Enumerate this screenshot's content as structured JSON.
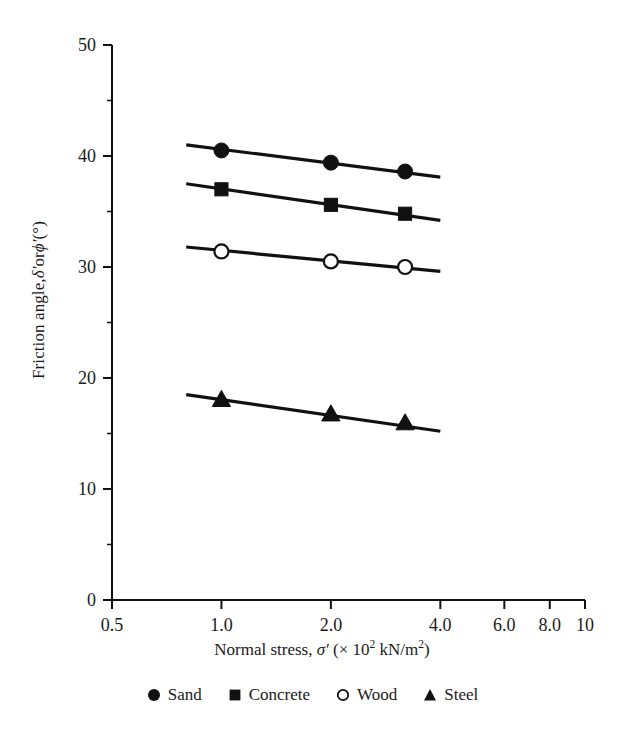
{
  "chart_data": {
    "type": "line",
    "title": "",
    "xlabel": "Normal stress, σ′ (× 10² kN/m²)",
    "ylabel": "Friction angle, δ′ or ϕ′ (°)",
    "xscale": "log",
    "xlim": [
      0.5,
      10
    ],
    "ylim": [
      0,
      50
    ],
    "xticks": [
      0.5,
      1.0,
      2.0,
      4.0,
      6.0,
      8.0,
      10
    ],
    "xtick_labels": [
      "0.5",
      "1.0",
      "2.0",
      "4.0",
      "6.0",
      "8.0",
      "10"
    ],
    "yticks": [
      0,
      10,
      20,
      30,
      40,
      50
    ],
    "ytick_labels": [
      "0",
      "10",
      "20",
      "30",
      "40",
      "50"
    ],
    "yminor_ticks": [
      5,
      15,
      25,
      35,
      45
    ],
    "grid": false,
    "legend_position": "below-axes",
    "x": [
      1.0,
      2.0,
      3.2
    ],
    "series": [
      {
        "name": "Sand",
        "marker": "filled-circle",
        "values": [
          40.5,
          39.4,
          38.6
        ],
        "line_x": [
          0.8,
          4.0
        ],
        "line_y": [
          41.0,
          38.1
        ],
        "color": "#111111"
      },
      {
        "name": "Concrete",
        "marker": "filled-square",
        "values": [
          37.0,
          35.6,
          34.8
        ],
        "line_x": [
          0.8,
          4.0
        ],
        "line_y": [
          37.5,
          34.2
        ],
        "color": "#111111"
      },
      {
        "name": "Wood",
        "marker": "open-circle",
        "values": [
          31.4,
          30.5,
          30.0
        ],
        "line_x": [
          0.8,
          4.0
        ],
        "line_y": [
          31.8,
          29.6
        ],
        "color": "#111111"
      },
      {
        "name": "Steel",
        "marker": "filled-triangle",
        "values": [
          18.0,
          16.7,
          15.9
        ],
        "line_x": [
          0.8,
          4.0
        ],
        "line_y": [
          18.5,
          15.2
        ],
        "color": "#111111"
      }
    ]
  },
  "axis": {
    "ylabel_parts": {
      "prefix": "Friction angle, ",
      "sym1": "δ′",
      "mid": " or ",
      "sym2": "ϕ′",
      "suffix": " (°)"
    },
    "xlabel_parts": {
      "prefix": "Normal stress, ",
      "sym": "σ′",
      "open": " (× 10",
      "exp": "2",
      "close": " kN/m",
      "exp2": "2",
      "tail": ")"
    }
  },
  "legend": {
    "items": [
      {
        "label": "Sand",
        "marker": "filled-circle"
      },
      {
        "label": "Concrete",
        "marker": "filled-square"
      },
      {
        "label": "Wood",
        "marker": "open-circle"
      },
      {
        "label": "Steel",
        "marker": "filled-triangle"
      }
    ]
  },
  "style": {
    "axis_color": "#1a1a1a",
    "ink": "#111111",
    "background": "#ffffff"
  }
}
